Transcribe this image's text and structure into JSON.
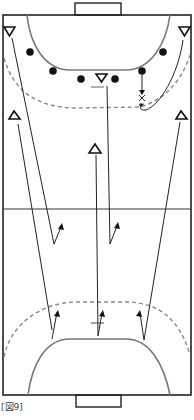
{
  "figure": {
    "caption": "[図9]"
  },
  "legend": {
    "attacker_symbol": "triangle",
    "defender_symbol": "filled-circle",
    "ball_mark": "x"
  },
  "colors": {
    "line": "#222222",
    "arc": "#777777",
    "dashed": "#888888",
    "background": "#ffffff"
  }
}
